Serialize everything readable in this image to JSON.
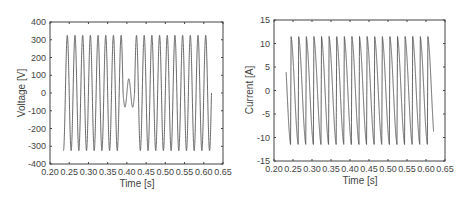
{
  "chart_data": [
    {
      "type": "line",
      "title": "",
      "xlabel": "Time [s]",
      "ylabel": "Voltage [V]",
      "xlim": [
        0.2,
        0.65
      ],
      "ylim": [
        -400,
        400
      ],
      "xticks": [
        "0.20",
        "0.25",
        "0.30",
        "0.35",
        "0.40",
        "0.45",
        "0.50",
        "0.55",
        "0.60",
        "0.65"
      ],
      "yticks": [
        "400",
        "300",
        "200",
        "100",
        "0",
        "-100",
        "-200",
        "-300",
        "-400"
      ],
      "grid": false,
      "legend": null,
      "series": [
        {
          "name": "Voltage",
          "description": "50 Hz sine, amplitude ~325 V, from t=0.235 s to t=0.62 s; voltage dip (sag to ~80 V amplitude) around t=0.40-0.42 s",
          "frequency_hz": 50,
          "amplitude": 325,
          "t_start": 0.235,
          "t_end": 0.62,
          "dip": {
            "t_start": 0.39,
            "t_end": 0.42,
            "amplitude": 80
          },
          "color": "#555555"
        }
      ]
    },
    {
      "type": "line",
      "title": "",
      "xlabel": "Time [s]",
      "ylabel": "Current [A]",
      "xlim": [
        0.2,
        0.65
      ],
      "ylim": [
        -15,
        15
      ],
      "xticks": [
        "0.20",
        "0.25",
        "0.30",
        "0.35",
        "0.40",
        "0.45",
        "0.50",
        "0.55",
        "0.60",
        "0.65"
      ],
      "yticks": [
        "15",
        "10",
        "5",
        "0",
        "-5",
        "-10",
        "-15"
      ],
      "grid": false,
      "legend": null,
      "series": [
        {
          "name": "Current",
          "description": "Periodic sawtooth-like current, 50 Hz, peaks ~+11.5 A and ~-11.5 A, from t=0.232 s to t=0.62 s (ends near 5 A)",
          "frequency_hz": 50,
          "amplitude": 11.5,
          "t_start": 0.232,
          "t_end": 0.62,
          "color": "#555555"
        }
      ]
    }
  ]
}
